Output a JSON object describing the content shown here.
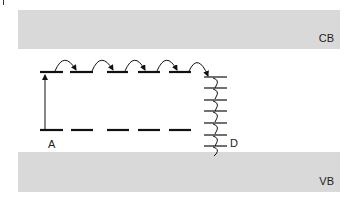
{
  "diagram": {
    "bands": {
      "conduction": {
        "label": "CB",
        "color": "#d9d9d9"
      },
      "valence": {
        "label": "VB",
        "color": "#d9d9d9"
      }
    },
    "levels": {
      "acceptor_label": "A",
      "defect_label": "D"
    },
    "upper_states": {
      "count": 5,
      "y": 72
    },
    "lower_states": {
      "count": 5,
      "y": 130
    },
    "defect_levels": {
      "count": 7
    },
    "hops": {
      "count": 5
    },
    "line_color": "#111111"
  }
}
